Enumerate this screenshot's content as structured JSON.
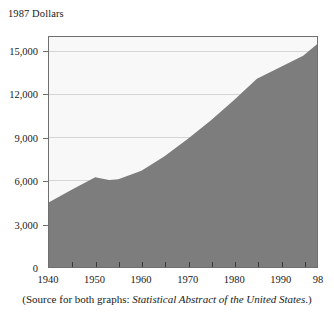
{
  "figure": {
    "y_axis_title": "1987 Dollars",
    "caption_prefix": "(Source for both graphs: ",
    "caption_italic": "Statistical Abstract of the United States",
    "caption_suffix": ".)"
  },
  "colors": {
    "area_fill": "#7d7d7d",
    "plot_background": "#f8f8f8",
    "frame": "#6f6f6f",
    "gridline": "#d6d6d6",
    "text": "#1a1a1a"
  },
  "chart_data": {
    "type": "area",
    "title": "",
    "subtitle": "",
    "xlabel": "",
    "ylabel": "1987 Dollars",
    "xlim": [
      1940,
      1998
    ],
    "ylim": [
      0,
      16000
    ],
    "grid": true,
    "legend": "none",
    "y_ticks": [
      0,
      3000,
      6000,
      9000,
      12000,
      15000
    ],
    "y_tick_labels": [
      "0",
      "3,000",
      "6,000",
      "9,000",
      "12,000",
      "15,000"
    ],
    "x_ticks": [
      1940,
      1950,
      1960,
      1970,
      1980,
      1990,
      1998
    ],
    "x_tick_labels": [
      "1940",
      "1950",
      "1960",
      "1970",
      "1980",
      "1990",
      "98"
    ],
    "x_minor_tick_interval": 5,
    "series": [
      {
        "name": "1987 Dollars",
        "x": [
          1940,
          1945,
          1950,
          1953,
          1955,
          1960,
          1965,
          1970,
          1975,
          1980,
          1985,
          1990,
          1995,
          1998
        ],
        "values": [
          4500,
          5400,
          6250,
          6050,
          6100,
          6700,
          7700,
          8900,
          10200,
          11600,
          13100,
          13900,
          14700,
          15500
        ]
      }
    ]
  }
}
